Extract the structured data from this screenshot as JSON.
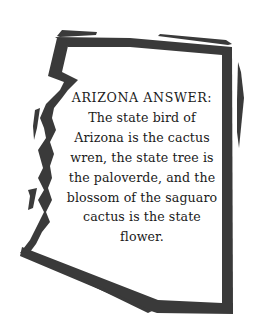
{
  "card": {
    "shape": "arizona-state-outline",
    "outline_color": "#3a3a3a",
    "background_color": "#ffffff",
    "heading": "ARIZONA ANSWER:",
    "body_lines": [
      "The state bird of",
      "Arizona is the cactus",
      "wren, the state tree is",
      "the paloverde, and the",
      "blossom of the saguaro",
      "cactus is the state",
      "flower."
    ]
  }
}
